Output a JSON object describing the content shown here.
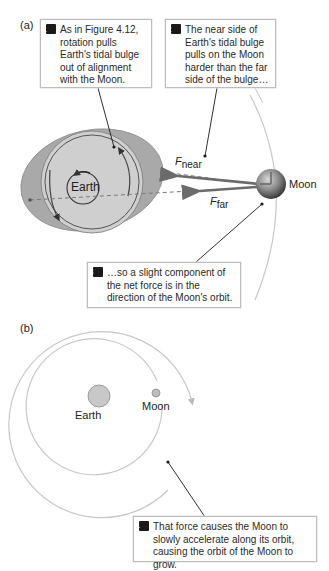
{
  "panel_a": {
    "label": "(a)",
    "callout1": {
      "num": "1",
      "text": "As in Figure 4.12, rotation pulls Earth's tidal bulge out of alignment with the Moon."
    },
    "callout2": {
      "num": "2",
      "text": "The near side of Earth's tidal bulge pulls on the Moon harder than the far side of the bulge…"
    },
    "callout3": {
      "num": "3",
      "text": "…so a slight component of the net force is in the direction of the Moon's orbit."
    },
    "earth_label": "Earth",
    "moon_label": "Moon",
    "force_near": {
      "symbol": "F",
      "subscript": "near"
    },
    "force_far": {
      "symbol": "F",
      "subscript": "far"
    }
  },
  "panel_b": {
    "label": "(b)",
    "earth_label": "Earth",
    "moon_label": "Moon",
    "callout4": {
      "num": "4",
      "text": "That force causes the Moon to slowly accelerate along its orbit, causing the orbit of the Moon to grow."
    }
  },
  "colors": {
    "bulge_fill": "#a9a9a9",
    "earth_fill": "#cfcfcf",
    "orbit_line": "#c8c8c8",
    "force_arrow": "#6b6b6b",
    "leader_line": "#1a1a1a"
  }
}
